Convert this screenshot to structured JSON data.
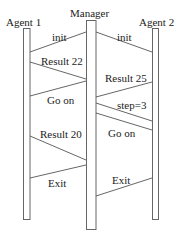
{
  "diagram": {
    "type": "sequence",
    "participants": [
      {
        "id": "agent1",
        "label": "Agent 1"
      },
      {
        "id": "manager",
        "label": "Manager"
      },
      {
        "id": "agent2",
        "label": "Agent 2"
      }
    ],
    "messages": [
      {
        "from": "manager",
        "to": "agent1",
        "label": "init"
      },
      {
        "from": "manager",
        "to": "agent2",
        "label": "init"
      },
      {
        "from": "agent1",
        "to": "manager",
        "label": "Result 22"
      },
      {
        "from": "manager",
        "to": "agent1",
        "label": "Go on"
      },
      {
        "from": "agent2",
        "to": "manager",
        "label": "Result 25"
      },
      {
        "from": "manager",
        "to": "agent2",
        "label": "step=3"
      },
      {
        "from": "manager",
        "to": "agent2",
        "label": "Go on"
      },
      {
        "from": "agent1",
        "to": "manager",
        "label": "Result 20"
      },
      {
        "from": "manager",
        "to": "agent1",
        "label": "Exit"
      },
      {
        "from": "agent2",
        "to": "manager",
        "label": "Exit"
      }
    ],
    "colors": {
      "line": "#555555",
      "text": "#222222",
      "background": "#ffffff"
    }
  }
}
